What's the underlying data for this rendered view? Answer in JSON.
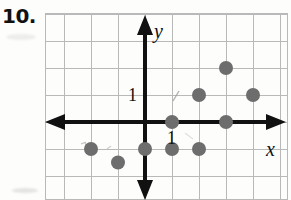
{
  "problem": {
    "number": "10."
  },
  "axes": {
    "x_label": "x",
    "y_label": "y",
    "x_tick_label": "1",
    "y_tick_label": "1",
    "axis_color": "#111111",
    "grid_color": "#b9b9b9"
  },
  "chart_data": {
    "type": "scatter",
    "title": "",
    "xlabel": "x",
    "ylabel": "y",
    "xlim": [
      -4,
      5
    ],
    "ylim": [
      -3,
      4
    ],
    "grid": true,
    "legend": "none",
    "point_color": "#6d6d6d",
    "point_radius_px": 7,
    "annotations": [
      "1",
      "1"
    ],
    "x": [
      1,
      3,
      2,
      4,
      3,
      1,
      2,
      0,
      -1,
      -2
    ],
    "y": [
      0,
      0,
      1,
      1,
      2,
      -1,
      -1,
      -1,
      -1.5,
      -1
    ],
    "points": [
      {
        "x": 1,
        "y": 0
      },
      {
        "x": 3,
        "y": 0
      },
      {
        "x": 2,
        "y": 1
      },
      {
        "x": 4,
        "y": 1
      },
      {
        "x": 3,
        "y": 2
      },
      {
        "x": 1,
        "y": -1
      },
      {
        "x": 2,
        "y": -1
      },
      {
        "x": 0,
        "y": -1
      },
      {
        "x": -1,
        "y": -1.5
      },
      {
        "x": -2,
        "y": -1
      }
    ]
  }
}
